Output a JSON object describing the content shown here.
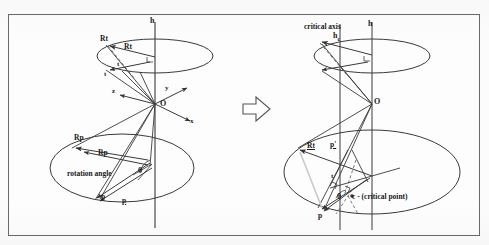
{
  "figure": {
    "type": "geometric-diagram",
    "transition_icon": "right-arrow-icon"
  },
  "left_panel": {
    "axis_label": "h",
    "origin_label": "O",
    "axes": [
      {
        "name": "x",
        "label": "x"
      },
      {
        "name": "y",
        "label": "y"
      },
      {
        "name": "z",
        "label": "z"
      }
    ],
    "upper_labels": [
      {
        "name": "Rt-upper-left",
        "label": "Rt"
      },
      {
        "name": "Rt-upper-right",
        "label": "Rt"
      },
      {
        "name": "t-vector",
        "label": "t"
      },
      {
        "name": "t-point",
        "label": "t"
      }
    ],
    "lower_labels": [
      {
        "name": "Rp-upper",
        "label": "Rp"
      },
      {
        "name": "Rp-lower",
        "label": "Rp"
      },
      {
        "name": "p-left",
        "label": "p"
      },
      {
        "name": "p-right",
        "label": "p"
      }
    ],
    "rotation_angle_text": "rotation angle",
    "theta_symbol": "θ"
  },
  "right_panel": {
    "critical_axis_label": "critical axis",
    "critical_axis_symbol": "h",
    "critical_axis_subscript": "c",
    "axis_label": "h",
    "origin_label": "O",
    "labels": [
      {
        "name": "Rt-label",
        "label": "Rt"
      },
      {
        "name": "p-prime-label",
        "label": "p'"
      },
      {
        "name": "t-label",
        "label": "t"
      },
      {
        "name": "p-label",
        "label": "p"
      }
    ],
    "theta_symbol": "θ",
    "critical_point_label": "c - (critical point)"
  },
  "colors": {
    "stroke": "#3a3a3a",
    "border": "#6b6b6b",
    "background": "#fdfdfd",
    "dashed": "#555555"
  }
}
